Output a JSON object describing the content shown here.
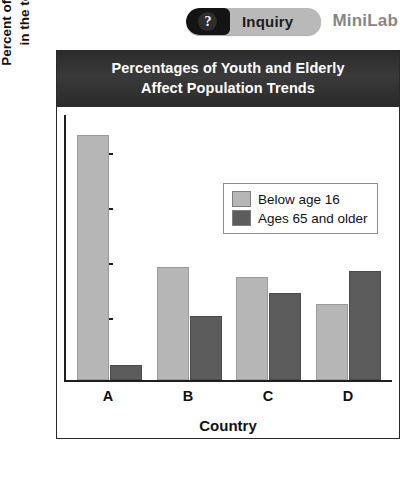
{
  "header": {
    "question_icon": "question-mark-icon",
    "inquiry_label": "Inquiry",
    "minilab_label": "MiniLab"
  },
  "chart_data": {
    "type": "bar",
    "title": "Percentages of Youth and Elderly Affect Population Trends",
    "title_line1": "Percentages of Youth and Elderly",
    "title_line2": "Affect Population Trends",
    "xlabel": "Country",
    "ylabel": "Percent of youth and elderly in the total population",
    "ylabel_line1": "Percent of youth and elderly",
    "ylabel_line2": "in the total population",
    "categories": [
      "A",
      "B",
      "C",
      "D"
    ],
    "ylim": [
      0,
      47
    ],
    "yticks": [
      0,
      10,
      20,
      30,
      40
    ],
    "ytick_labels": [
      "0",
      "10",
      "20",
      "30",
      "40"
    ],
    "grid": false,
    "legend_position": "upper right",
    "series": [
      {
        "name": "Below age 16",
        "color": "#b6b6b6",
        "values": [
          44.5,
          20.5,
          18.7,
          13.8
        ]
      },
      {
        "name": "Ages 65 and older",
        "color": "#5c5c5c",
        "values": [
          2.8,
          11.7,
          15.8,
          19.8
        ]
      }
    ]
  }
}
